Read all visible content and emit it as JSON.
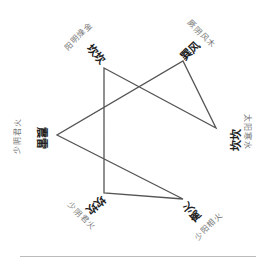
{
  "diagram": {
    "type": "closed-star-polyline",
    "stroke_color": "#555555",
    "path": [
      [
        104,
        68
      ],
      [
        216,
        128
      ],
      [
        183,
        61
      ],
      [
        57,
        135
      ],
      [
        183,
        199
      ],
      [
        104,
        193
      ]
    ],
    "nodes": [
      {
        "id": "top-left",
        "main": "坎坎",
        "sub": "阳明燥金",
        "x": 104,
        "y": 68
      },
      {
        "id": "top-right",
        "main": "巽风",
        "sub": "厥阴风木",
        "x": 183,
        "y": 61
      },
      {
        "id": "right",
        "main": "坎坎",
        "sub": "太阳寒水",
        "x": 216,
        "y": 128
      },
      {
        "id": "bottom-right",
        "main": "离火",
        "sub": "少阳相火",
        "x": 183,
        "y": 199
      },
      {
        "id": "bottom-left",
        "main": "坎坎",
        "sub": "少阴君火",
        "x": 104,
        "y": 193
      },
      {
        "id": "left",
        "main": "震雷",
        "sub": "少阴君火",
        "x": 57,
        "y": 135
      }
    ]
  }
}
